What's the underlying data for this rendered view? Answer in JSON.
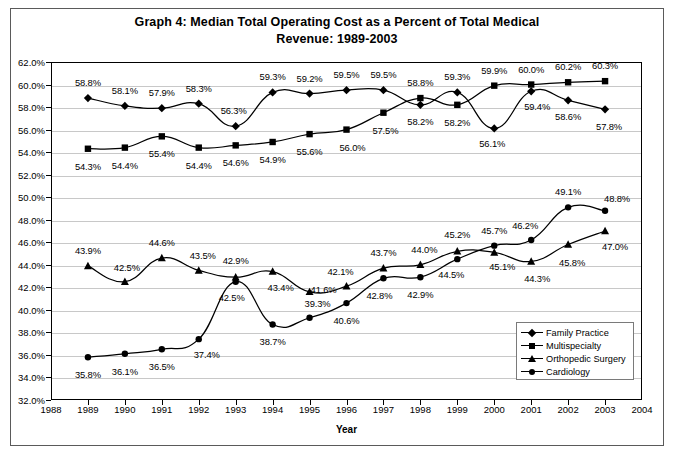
{
  "title": {
    "line1": "Graph 4:  Median Total Operating Cost as a Percent of Total Medical",
    "line2": "Revenue: 1989-2003"
  },
  "axes": {
    "x_title": "Year",
    "y_ticks": [
      "32.0%",
      "34.0%",
      "36.0%",
      "38.0%",
      "40.0%",
      "42.0%",
      "44.0%",
      "46.0%",
      "48.0%",
      "50.0%",
      "52.0%",
      "54.0%",
      "56.0%",
      "58.0%",
      "60.0%",
      "62.0%"
    ],
    "x_ticks": [
      "1988",
      "1989",
      "1990",
      "1991",
      "1992",
      "1993",
      "1994",
      "1995",
      "1996",
      "1997",
      "1998",
      "1999",
      "2000",
      "2001",
      "2002",
      "2003",
      "2004"
    ]
  },
  "legend": {
    "position": "bottom-right",
    "items": [
      {
        "label": "Family Practice",
        "marker": "diamond"
      },
      {
        "label": "Multispecialty",
        "marker": "square"
      },
      {
        "label": "Orthopedic Surgery",
        "marker": "triangle"
      },
      {
        "label": "Cardiology",
        "marker": "circle"
      }
    ]
  },
  "chart_data": {
    "type": "line",
    "title": "Graph 4:  Median Total Operating Cost as a Percent of Total Medical Revenue: 1989-2003",
    "xlabel": "Year",
    "ylabel": "",
    "xlim": [
      1988,
      2004
    ],
    "ylim": [
      32.0,
      62.0
    ],
    "ytick_step": 2.0,
    "grid": true,
    "legend_position": "bottom-right",
    "x": [
      1989,
      1990,
      1991,
      1992,
      1993,
      1994,
      1995,
      1996,
      1997,
      1998,
      1999,
      2000,
      2001,
      2002,
      2003
    ],
    "series": [
      {
        "name": "Family Practice",
        "marker": "diamond",
        "color": "#000000",
        "values": [
          58.8,
          58.1,
          57.9,
          58.3,
          56.3,
          59.3,
          59.2,
          59.5,
          59.5,
          58.2,
          59.3,
          56.1,
          59.4,
          58.6,
          57.8
        ],
        "labels": [
          "58.8%",
          "58.1%",
          "57.9%",
          "58.3%",
          "56.3%",
          "59.3%",
          "59.2%",
          "59.5%",
          "59.5%",
          "58.2%",
          "59.3%",
          "56.1%",
          "59.4%",
          "58.6%",
          "57.8%"
        ]
      },
      {
        "name": "Multispecialty",
        "marker": "square",
        "color": "#000000",
        "values": [
          54.3,
          54.4,
          55.4,
          54.4,
          54.6,
          54.9,
          55.6,
          56.0,
          57.5,
          58.8,
          58.2,
          59.9,
          60.0,
          60.2,
          60.3
        ],
        "labels": [
          "54.3%",
          "54.4%",
          "55.4%",
          "54.4%",
          "54.6%",
          "54.9%",
          "55.6%",
          "56.0%",
          "57.5%",
          "58.8%",
          "58.2%",
          "59.9%",
          "60.0%",
          "60.2%",
          "60.3%"
        ]
      },
      {
        "name": "Orthopedic Surgery",
        "marker": "triangle",
        "color": "#000000",
        "values": [
          43.9,
          42.5,
          44.6,
          43.5,
          42.9,
          43.4,
          41.6,
          42.1,
          43.7,
          44.0,
          45.2,
          45.1,
          44.3,
          45.8,
          47.0
        ],
        "labels": [
          "43.9%",
          "42.5%",
          "44.6%",
          "43.5%",
          "42.9%",
          "43.4%",
          "41.6%",
          "42.1%",
          "43.7%",
          "44.0%",
          "45.2%",
          "45.1%",
          "44.3%",
          "45.8%",
          "47.0%"
        ]
      },
      {
        "name": "Cardiology",
        "marker": "circle",
        "color": "#000000",
        "values": [
          35.8,
          36.1,
          36.5,
          37.4,
          42.5,
          38.7,
          39.3,
          40.6,
          42.8,
          42.9,
          44.5,
          45.7,
          46.2,
          49.1,
          48.8
        ],
        "labels": [
          "35.8%",
          "36.1%",
          "36.5%",
          "37.4%",
          "42.5%",
          "38.7%",
          "39.3%",
          "40.6%",
          "42.8%",
          "42.9%",
          "44.5%",
          "45.7%",
          "46.2%",
          "49.1%",
          "48.8%"
        ]
      }
    ],
    "label_offsets": {
      "Family Practice": [
        [
          0,
          -16
        ],
        [
          0,
          -16
        ],
        [
          0,
          -16
        ],
        [
          0,
          -16
        ],
        [
          -2,
          -16
        ],
        [
          0,
          -16
        ],
        [
          0,
          -16
        ],
        [
          0,
          -16
        ],
        [
          0,
          -16
        ],
        [
          0,
          16
        ],
        [
          0,
          -16
        ],
        [
          -2,
          15
        ],
        [
          6,
          15
        ],
        [
          0,
          16
        ],
        [
          4,
          17
        ]
      ],
      "Multispecialty": [
        [
          0,
          17
        ],
        [
          0,
          17
        ],
        [
          0,
          17
        ],
        [
          0,
          17
        ],
        [
          0,
          17
        ],
        [
          0,
          17
        ],
        [
          0,
          17
        ],
        [
          6,
          17
        ],
        [
          2,
          17
        ],
        [
          0,
          -16
        ],
        [
          0,
          17
        ],
        [
          0,
          -16
        ],
        [
          0,
          -16
        ],
        [
          0,
          -16
        ],
        [
          0,
          -16
        ]
      ],
      "Orthopedic Surgery": [
        [
          0,
          -16
        ],
        [
          2,
          -15
        ],
        [
          0,
          -16
        ],
        [
          4,
          -15
        ],
        [
          0,
          -17
        ],
        [
          8,
          15
        ],
        [
          14,
          -3
        ],
        [
          -6,
          -15
        ],
        [
          0,
          -16
        ],
        [
          4,
          -16
        ],
        [
          0,
          -17
        ],
        [
          8,
          14
        ],
        [
          6,
          17
        ],
        [
          4,
          17
        ],
        [
          10,
          15
        ]
      ],
      "Cardiology": [
        [
          0,
          17
        ],
        [
          0,
          17
        ],
        [
          0,
          17
        ],
        [
          8,
          15
        ],
        [
          -4,
          15
        ],
        [
          0,
          16
        ],
        [
          8,
          -15
        ],
        [
          0,
          17
        ],
        [
          -4,
          17
        ],
        [
          0,
          17
        ],
        [
          -6,
          15
        ],
        [
          0,
          -16
        ],
        [
          -6,
          -15
        ],
        [
          0,
          -16
        ],
        [
          12,
          -13
        ]
      ]
    }
  }
}
